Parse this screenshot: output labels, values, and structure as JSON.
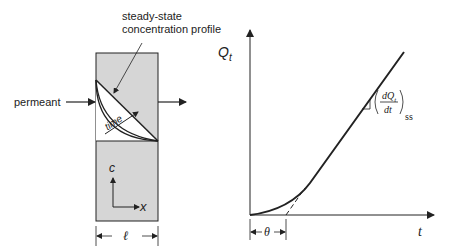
{
  "left_panel": {
    "annotation_line1": "steady-state",
    "annotation_line2": "concentration profile",
    "inlet_label": "permeant",
    "time_label": "time",
    "axis_c": "c",
    "axis_x": "x",
    "thickness_label": "ℓ",
    "colors": {
      "membrane_fill": "#d6d6d6",
      "stroke": "#222222"
    }
  },
  "right_panel": {
    "y_axis_label": "Q",
    "y_axis_sub": "t",
    "x_axis_label": "t",
    "lag_label": "θ",
    "slope_num": "dQ",
    "slope_num_sub": "t",
    "slope_den": "dt",
    "slope_sub": "ss"
  }
}
